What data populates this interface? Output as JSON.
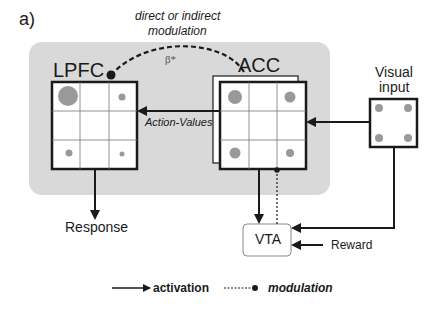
{
  "panel_label": "a)",
  "modulation_note": {
    "line1": "direct or indirect",
    "line2": "modulation"
  },
  "beta_label": "β*",
  "nodes": {
    "lpfc": "LPFC",
    "acc": "ACC",
    "visual_input": {
      "line1": "Visual",
      "line2": "input"
    },
    "vta": "VTA"
  },
  "edge_labels": {
    "action_values": "Action-Values",
    "response": "Response",
    "reward": "Reward"
  },
  "legend": {
    "activation": "activation",
    "modulation": "modulation"
  },
  "colors": {
    "panel_bg": "#d9d9d9",
    "dot": "#999999",
    "line": "#1a1a1a"
  }
}
